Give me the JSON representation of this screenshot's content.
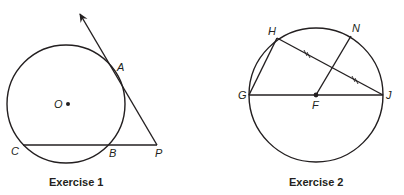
{
  "figures": [
    {
      "caption": "Exercise 1",
      "points": {
        "O": "O",
        "A": "A",
        "B": "B",
        "C": "C",
        "P": "P"
      }
    },
    {
      "caption": "Exercise 2",
      "points": {
        "H": "H",
        "N": "N",
        "G": "G",
        "F": "F",
        "J": "J"
      },
      "tick_marks": "//"
    }
  ],
  "colors": {
    "stroke": "#231f20",
    "background": "#ffffff"
  }
}
